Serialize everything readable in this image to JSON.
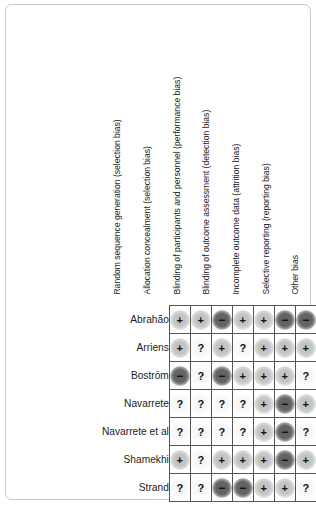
{
  "figure": {
    "type": "risk-of-bias-summary",
    "columns": [
      "Random sequence generation (selection bias)",
      "Allocation concealment (selection bias)",
      "Blinding of participants and personnel (performance bias)",
      "Blinding of outcome assessment (detection bias)",
      "Incomplete outcome data (attrition bias)",
      "Selective reporting (reporting bias)",
      "Other bias"
    ],
    "rows": [
      "Abrahão",
      "Arriens",
      "Boström",
      "Navarrete",
      "Navarrete et al",
      "Shamekhi",
      "Strand"
    ],
    "symbols": {
      "low": "+",
      "high": "−",
      "unclear": "?"
    },
    "colors": {
      "low_risk": "#c4c4c4",
      "high_risk": "#646464",
      "unclear_risk": "#f8f8f8",
      "grid_line": "#555555",
      "frame": "#c9c9c9",
      "text": "#1c1c1c"
    }
  },
  "chart_data": {
    "type": "heatmap",
    "title": "",
    "xlabel": "",
    "ylabel": "",
    "categories": [
      "Random sequence generation (selection bias)",
      "Allocation concealment (selection bias)",
      "Blinding of participants and personnel (performance bias)",
      "Blinding of outcome assessment (detection bias)",
      "Incomplete outcome data (attrition bias)",
      "Selective reporting (reporting bias)",
      "Other bias"
    ],
    "row_labels": [
      "Abrahão",
      "Arriens",
      "Boström",
      "Navarrete",
      "Navarrete et al",
      "Shamekhi",
      "Strand"
    ],
    "legend": [
      {
        "key": "low",
        "symbol": "+",
        "meaning": "Low risk of bias"
      },
      {
        "key": "high",
        "symbol": "−",
        "meaning": "High risk of bias"
      },
      {
        "key": "unclear",
        "symbol": "?",
        "meaning": "Unclear risk of bias"
      }
    ],
    "grid": true,
    "values": [
      [
        "low",
        "low",
        "high",
        "low",
        "low",
        "high",
        "high"
      ],
      [
        "low",
        "unclear",
        "low",
        "unclear",
        "low",
        "low",
        "low"
      ],
      [
        "high",
        "unclear",
        "high",
        "low",
        "low",
        "low",
        "unclear"
      ],
      [
        "unclear",
        "unclear",
        "unclear",
        "unclear",
        "low",
        "high",
        "low"
      ],
      [
        "unclear",
        "unclear",
        "unclear",
        "unclear",
        "low",
        "high",
        "unclear"
      ],
      [
        "low",
        "unclear",
        "low",
        "low",
        "low",
        "high",
        "low"
      ],
      [
        "unclear",
        "unclear",
        "high",
        "high",
        "low",
        "low",
        "unclear"
      ]
    ]
  }
}
